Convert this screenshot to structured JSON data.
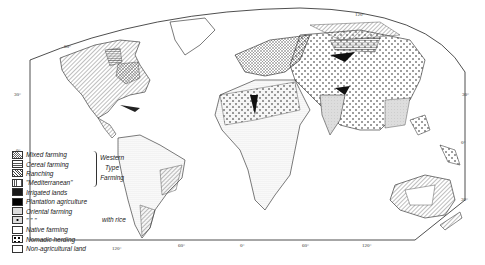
{
  "map": {
    "type": "world agricultural regions map",
    "latitude_labels": [
      "60°",
      "30°",
      "0°",
      "30°",
      "30°",
      "0°",
      "30°"
    ],
    "longitude_labels": [
      "120°",
      "60°",
      "0°",
      "60°",
      "120°"
    ],
    "top_label": "120°"
  },
  "legend": {
    "items": [
      {
        "label": "Mixed farming",
        "pattern": "crosshatch"
      },
      {
        "label": "Cereal farming",
        "pattern": "horizontal-lines"
      },
      {
        "label": "Ranching",
        "pattern": "diagonal-lines"
      },
      {
        "label": "\"Mediterranean\"",
        "pattern": "vertical-lines"
      },
      {
        "label": "Irrigated lands",
        "pattern": "solid-dark"
      },
      {
        "label": "Plantation agriculture",
        "pattern": "solid-black"
      },
      {
        "label": "Oriental farming",
        "pattern": "light-gray"
      },
      {
        "label": "\"      \"      \"",
        "pattern": "gray-with-dot"
      },
      {
        "label": "Native farming",
        "pattern": "fine-dots"
      },
      {
        "label": "Nomadic herding",
        "pattern": "large-dots"
      },
      {
        "label": "Non-agricultural land",
        "pattern": "blank"
      }
    ],
    "group_label": [
      "Western",
      "Type",
      "Farming"
    ],
    "rice_label": "with rice"
  }
}
